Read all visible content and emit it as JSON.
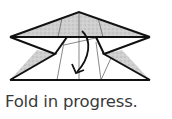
{
  "figure": {
    "caption": "Fold in progress.",
    "colors": {
      "stroke": "#111111",
      "shade": "#c8c8c8",
      "thin_line": "#555555",
      "caption": "#3a3a3a"
    }
  }
}
